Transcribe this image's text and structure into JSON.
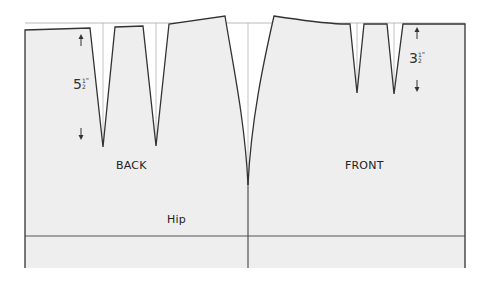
{
  "diagram": {
    "type": "skirt sloper pattern (back and front)",
    "colors": {
      "fill": "#eeeeee",
      "outline": "#333333",
      "guide": "#aaaaaa",
      "background": "#ffffff"
    },
    "labels": {
      "back": "BACK",
      "front": "FRONT",
      "hip": "Hip"
    },
    "measurements": {
      "back_dart_length": {
        "whole": "5",
        "numerator": "1",
        "denominator": "2",
        "unit": "\""
      },
      "front_dart_length": {
        "whole": "3",
        "numerator": "1",
        "denominator": "2",
        "unit": "\""
      }
    },
    "pieces": [
      {
        "name": "back",
        "darts": 2,
        "dart_length_in": 5.5
      },
      {
        "name": "front",
        "darts": 2,
        "dart_length_in": 3.5
      }
    ],
    "reference_lines": [
      "waist guideline",
      "hip line",
      "center side seam"
    ]
  }
}
